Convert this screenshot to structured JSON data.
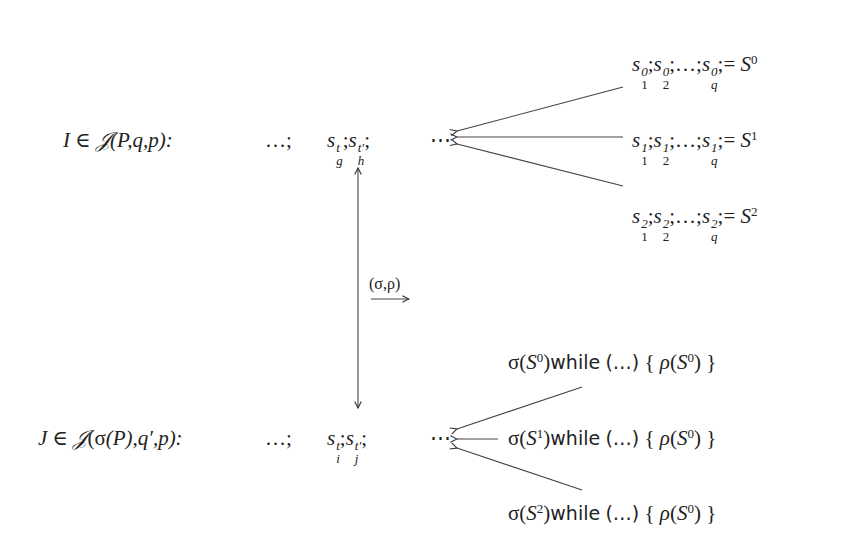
{
  "diagram": {
    "top_row": {
      "label": "I ∈ 𝒥(P,q,p):",
      "label_parts": {
        "var": "I",
        "rel": "∈",
        "set": "𝒥",
        "args": "(P,q,p):"
      },
      "ellipsis_left": "…;",
      "seq": {
        "s1_base": "s",
        "s1_sup": "t",
        "s1_sub": "g",
        "s2_base": "s",
        "s2_sup": "t′",
        "s2_sub": "h",
        "sep": ";"
      },
      "ellipsis_right": "⋯"
    },
    "top_branches": [
      {
        "text": "s¹…",
        "parts": {
          "sup": "0",
          "subs": [
            "1",
            "2",
            "q"
          ],
          "result": "S",
          "result_sup": "0"
        }
      },
      {
        "text": "s¹…",
        "parts": {
          "sup": "1",
          "subs": [
            "1",
            "2",
            "q"
          ],
          "result": "S",
          "result_sup": "1"
        }
      },
      {
        "text": "s²…",
        "parts": {
          "sup": "2",
          "subs": [
            "1",
            "2",
            "q"
          ],
          "result": "S",
          "result_sup": "2"
        }
      }
    ],
    "mapping": {
      "label": "(σ,ρ)",
      "arrow": "⟶"
    },
    "bottom_row": {
      "label_parts": {
        "var": "J",
        "rel": "∈",
        "set": "𝒥",
        "args_open": "(",
        "sigma": "σ",
        "inner": "(P)",
        "rest": ",q′,p):"
      },
      "ellipsis_left": "…;",
      "seq": {
        "s1_base": "s",
        "s1_sup": "t",
        "s1_sub": "i",
        "s2_base": "s",
        "s2_sup": "t′",
        "s2_sub": "j",
        "sep": ";"
      },
      "ellipsis_right": "⋯"
    },
    "bottom_branches": [
      {
        "sigma": "σ",
        "S_sup": "0",
        "keyword": "while",
        "cond": "(…)",
        "body_open": "{",
        "rho": "ρ",
        "body_S_sup": "0",
        "body_close": "}"
      },
      {
        "sigma": "σ",
        "S_sup": "1",
        "keyword": "while",
        "cond": "(…)",
        "body_open": "{",
        "rho": "ρ",
        "body_S_sup": "0",
        "body_close": "}"
      },
      {
        "sigma": "σ",
        "S_sup": "2",
        "keyword": "while",
        "cond": "(…)",
        "body_open": "{",
        "rho": "ρ",
        "body_S_sup": "0",
        "body_close": "}"
      }
    ],
    "colors": {
      "ink": "#222222",
      "background": "#ffffff"
    }
  }
}
